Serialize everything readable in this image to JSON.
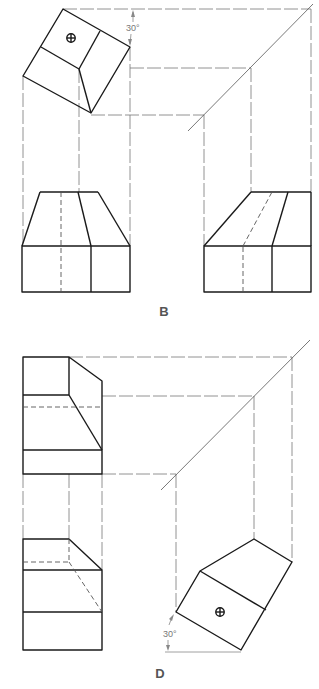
{
  "figure": {
    "type": "orthographic-projection-exercise",
    "panels": [
      {
        "label": "B",
        "angle_annotation": "30°",
        "views": [
          "top-view-rotated",
          "front-view",
          "right-side-view"
        ],
        "feature": "hole-symbol"
      },
      {
        "label": "D",
        "angle_annotation": "30°",
        "views": [
          "top-view",
          "front-view",
          "right-side-view-rotated"
        ],
        "feature": "hole-symbol"
      }
    ]
  },
  "labels": {
    "panel_b": "B",
    "panel_d": "D",
    "angle_b": "30°",
    "angle_d": "30°"
  },
  "colors": {
    "object_line": "#1a1a1a",
    "projection_line": "#777777",
    "label": "#555555"
  }
}
